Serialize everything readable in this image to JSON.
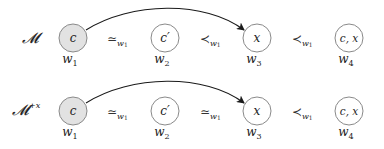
{
  "colors": {
    "node_stroke": "#8a8a8a",
    "node_fill_highlight": "#e2e2e2",
    "node_fill_default": "#ffffff",
    "arrow": "#1a1a1a",
    "text": "#222222"
  },
  "rows": [
    {
      "label": "𝓜",
      "label_sup": "",
      "nodes": [
        {
          "content": "c",
          "world": "w",
          "world_sub": "1",
          "highlighted": true
        },
        {
          "content": "c′",
          "world": "w",
          "world_sub": "2",
          "highlighted": false
        },
        {
          "content": "x",
          "world": "w",
          "world_sub": "3",
          "highlighted": false
        },
        {
          "content": "c, x",
          "world": "w",
          "world_sub": "4",
          "highlighted": false
        }
      ],
      "relations": [
        {
          "symbol": "≃",
          "sub": "w1"
        },
        {
          "symbol": "≺",
          "sub": "w1"
        },
        {
          "symbol": "≺",
          "sub": "w1"
        }
      ],
      "arrow": {
        "from": "w1",
        "to": "w3"
      }
    },
    {
      "label": "𝓜",
      "label_sup": "+x",
      "nodes": [
        {
          "content": "c",
          "world": "w",
          "world_sub": "1",
          "highlighted": true
        },
        {
          "content": "c′",
          "world": "w",
          "world_sub": "2",
          "highlighted": false
        },
        {
          "content": "x",
          "world": "w",
          "world_sub": "3",
          "highlighted": false
        },
        {
          "content": "c, x",
          "world": "w",
          "world_sub": "4",
          "highlighted": false
        }
      ],
      "relations": [
        {
          "symbol": "≃",
          "sub": "w1"
        },
        {
          "symbol": "≃",
          "sub": "w1"
        },
        {
          "symbol": "≺",
          "sub": "w1"
        }
      ],
      "arrow": {
        "from": "w1",
        "to": "w3"
      }
    }
  ]
}
